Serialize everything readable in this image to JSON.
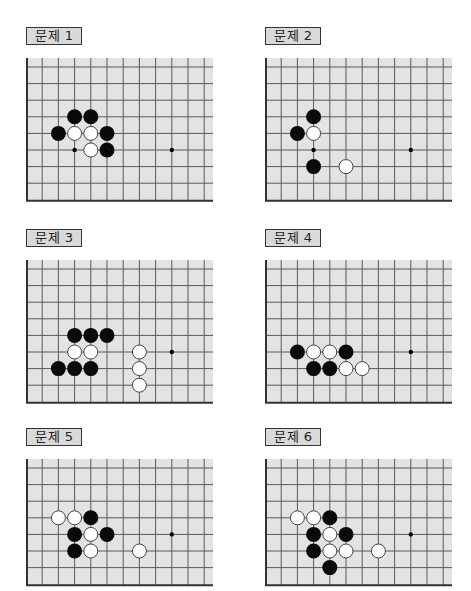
{
  "colors": {
    "board_bg": "#e3e3e3",
    "grid_line": "#5a5a5a",
    "border_line": "#333333",
    "black_stone": "#0a0a0a",
    "white_stone": "#ffffff",
    "white_outline": "#444444",
    "label_bg": "#d9d9d9"
  },
  "board_geometry": {
    "col_spacing": 16.2,
    "row_spacing": 16.6,
    "num_cols": 12,
    "width": 187,
    "stone_diameter": 15
  },
  "problems": [
    {
      "label": "문제 1",
      "left": 26,
      "top": 27,
      "rows": 8,
      "star_points": [
        [
          3,
          5
        ],
        [
          9,
          5
        ]
      ],
      "black": [
        [
          3,
          3
        ],
        [
          4,
          3
        ],
        [
          2,
          4
        ],
        [
          5,
          4
        ],
        [
          5,
          5
        ]
      ],
      "white": [
        [
          3,
          4
        ],
        [
          4,
          4
        ],
        [
          4,
          5
        ]
      ]
    },
    {
      "label": "문제 2",
      "left": 265,
      "top": 27,
      "rows": 8,
      "star_points": [
        [
          3,
          5
        ],
        [
          9,
          5
        ]
      ],
      "black": [
        [
          3,
          3
        ],
        [
          2,
          4
        ],
        [
          3,
          6
        ]
      ],
      "white": [
        [
          3,
          4
        ],
        [
          5,
          6
        ]
      ]
    },
    {
      "label": "문제 3",
      "left": 26,
      "top": 229,
      "rows": 8,
      "star_points": [
        [
          9,
          5
        ]
      ],
      "black": [
        [
          3,
          4
        ],
        [
          4,
          4
        ],
        [
          5,
          4
        ],
        [
          2,
          6
        ],
        [
          3,
          6
        ],
        [
          4,
          6
        ]
      ],
      "white": [
        [
          3,
          5
        ],
        [
          4,
          5
        ],
        [
          7,
          5
        ],
        [
          7,
          6
        ],
        [
          7,
          7
        ]
      ]
    },
    {
      "label": "문제 4",
      "left": 265,
      "top": 229,
      "rows": 8,
      "star_points": [
        [
          9,
          5
        ]
      ],
      "black": [
        [
          2,
          5
        ],
        [
          5,
          5
        ],
        [
          3,
          6
        ],
        [
          4,
          6
        ]
      ],
      "white": [
        [
          3,
          5
        ],
        [
          4,
          5
        ],
        [
          5,
          6
        ],
        [
          6,
          6
        ]
      ]
    },
    {
      "label": "문제 5",
      "left": 26,
      "top": 428,
      "rows": 7,
      "star_points": [
        [
          9,
          4
        ]
      ],
      "black": [
        [
          4,
          3
        ],
        [
          3,
          4
        ],
        [
          5,
          4
        ],
        [
          3,
          5
        ]
      ],
      "white": [
        [
          2,
          3
        ],
        [
          3,
          3
        ],
        [
          4,
          4
        ],
        [
          4,
          5
        ],
        [
          7,
          5
        ]
      ]
    },
    {
      "label": "문제 6",
      "left": 265,
      "top": 428,
      "rows": 7,
      "star_points": [
        [
          9,
          4
        ]
      ],
      "black": [
        [
          4,
          3
        ],
        [
          3,
          4
        ],
        [
          5,
          4
        ],
        [
          3,
          5
        ],
        [
          4,
          6
        ]
      ],
      "white": [
        [
          2,
          3
        ],
        [
          3,
          3
        ],
        [
          4,
          4
        ],
        [
          4,
          5
        ],
        [
          5,
          5
        ],
        [
          7,
          5
        ]
      ]
    }
  ]
}
